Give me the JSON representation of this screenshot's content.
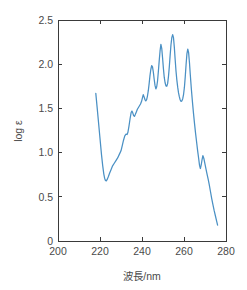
{
  "chart_data": {
    "type": "line",
    "title": "",
    "subtitle": "",
    "xlabel": "波長/nm",
    "ylabel": "log ε",
    "xlim": [
      200,
      280
    ],
    "ylim": [
      0,
      2.5
    ],
    "xticks": [
      200,
      220,
      240,
      260,
      280
    ],
    "xticklabels": [
      "200",
      "220",
      "240",
      "260",
      "280"
    ],
    "yticks": [
      0,
      0.5,
      1.0,
      1.5,
      2.0,
      2.5
    ],
    "yticklabels": [
      "0",
      "0.5",
      "1.0",
      "1.5",
      "2.0",
      "2.5"
    ],
    "grid": false,
    "legend": null,
    "series": [
      {
        "name": "absorption",
        "color": "#4a90c4",
        "x": [
          218.0,
          218.6,
          219.3,
          220.0,
          220.7,
          221.3,
          221.8,
          222.2,
          222.6,
          223.0,
          223.5,
          224.0,
          224.6,
          225.3,
          226.0,
          226.8,
          227.6,
          228.4,
          229.2,
          230.0,
          230.6,
          231.2,
          231.8,
          232.4,
          232.9,
          233.3,
          233.8,
          234.3,
          234.8,
          235.2,
          235.6,
          236.0,
          236.4,
          236.8,
          237.3,
          237.8,
          238.3,
          238.8,
          239.3,
          239.8,
          240.2,
          240.6,
          241.0,
          241.4,
          241.8,
          242.2,
          242.6,
          243.0,
          243.4,
          243.8,
          244.2,
          244.6,
          245.0,
          245.4,
          245.8,
          246.2,
          246.6,
          247.0,
          247.4,
          247.8,
          248.2,
          248.6,
          249.0,
          249.4,
          249.8,
          250.2,
          250.6,
          251.0,
          251.4,
          251.8,
          252.2,
          252.6,
          253.0,
          253.4,
          253.8,
          254.2,
          254.6,
          255.0,
          255.4,
          255.8,
          256.2,
          256.6,
          257.0,
          257.4,
          257.8,
          258.2,
          258.6,
          259.0,
          259.4,
          259.8,
          260.2,
          260.6,
          261.0,
          261.4,
          261.8,
          262.2,
          262.6,
          263.0,
          263.5,
          264.0,
          264.5,
          265.0,
          265.5,
          266.0,
          266.5,
          267.0,
          267.4,
          267.8,
          268.2,
          268.6,
          269.0,
          269.5,
          270.0,
          270.5,
          271.0,
          271.5,
          272.0,
          272.6,
          273.2,
          273.8,
          274.4,
          275.0,
          275.6,
          276.0
        ],
        "y": [
          1.67,
          1.52,
          1.34,
          1.16,
          0.98,
          0.85,
          0.76,
          0.71,
          0.685,
          0.68,
          0.7,
          0.73,
          0.77,
          0.81,
          0.85,
          0.88,
          0.91,
          0.94,
          0.98,
          1.02,
          1.08,
          1.14,
          1.19,
          1.21,
          1.205,
          1.23,
          1.3,
          1.38,
          1.45,
          1.47,
          1.45,
          1.42,
          1.41,
          1.43,
          1.46,
          1.49,
          1.51,
          1.53,
          1.55,
          1.58,
          1.62,
          1.655,
          1.63,
          1.6,
          1.585,
          1.6,
          1.64,
          1.7,
          1.78,
          1.87,
          1.94,
          1.985,
          1.97,
          1.91,
          1.83,
          1.76,
          1.72,
          1.745,
          1.81,
          1.92,
          2.04,
          2.15,
          2.225,
          2.18,
          2.07,
          1.95,
          1.85,
          1.79,
          1.755,
          1.75,
          1.78,
          1.86,
          1.97,
          2.1,
          2.22,
          2.3,
          2.335,
          2.3,
          2.19,
          2.05,
          1.92,
          1.82,
          1.74,
          1.675,
          1.63,
          1.595,
          1.58,
          1.585,
          1.61,
          1.66,
          1.74,
          1.86,
          2.0,
          2.12,
          2.17,
          2.13,
          2.02,
          1.88,
          1.72,
          1.58,
          1.45,
          1.33,
          1.22,
          1.12,
          1.02,
          0.93,
          0.855,
          0.82,
          0.86,
          0.92,
          0.965,
          0.93,
          0.87,
          0.81,
          0.755,
          0.7,
          0.64,
          0.56,
          0.48,
          0.41,
          0.34,
          0.28,
          0.22,
          0.18
        ]
      }
    ]
  },
  "axes": {
    "box_color": "#3a3a3a",
    "background": "#ffffff"
  }
}
